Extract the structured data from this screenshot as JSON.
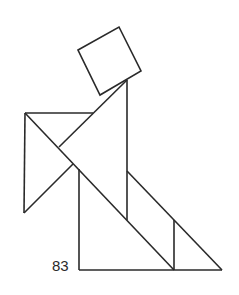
{
  "figure": {
    "type": "tangram",
    "number_label": "83",
    "stroke_color": "#2a2a2a",
    "background": "#ffffff",
    "pieces": [
      {
        "name": "square",
        "points": "78,50 119,27 141,71 100,95"
      },
      {
        "name": "large-triangle-body",
        "points": "127,80 127,220 59,147"
      },
      {
        "name": "left-triangle",
        "points": "25,113 93,113 24,213"
      },
      {
        "name": "medium-triangle-front",
        "points": "25,113 59,147 59,147"
      },
      {
        "name": "large-triangle-lower",
        "points": "73,163 173,270 79,270"
      },
      {
        "name": "right-triangle",
        "points": "127,171 222,270 174,270"
      },
      {
        "name": "small-triangle",
        "points": "174,220 174,270 222,270"
      }
    ]
  }
}
